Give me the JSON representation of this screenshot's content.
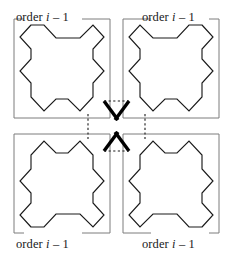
{
  "figure": {
    "width": 237,
    "height": 259,
    "background_color": "#ffffff"
  },
  "labels": {
    "prefix": "order",
    "variable": "i",
    "operator": "–",
    "offset": "1",
    "top_left": "order i – 1",
    "top_right": "order i – 1",
    "bottom_left": "order i – 1",
    "bottom_right": "order i – 1"
  },
  "colors": {
    "curve": "#1a1a1a",
    "frame": "#7d7d7d",
    "connector": "#1a1a1a",
    "join_stub": "#000000",
    "label_text": "#1a1a1a",
    "background": "#ffffff"
  },
  "strokes": {
    "curve_width": 1.15,
    "frame_width": 1.0,
    "connector_width": 1.1,
    "connector_dash": "2.2 2.4",
    "stub_width": 3.4
  },
  "geometry": {
    "cells": [
      {
        "name": "top-left",
        "x": 14,
        "y": 19,
        "w": 96,
        "h": 99,
        "flip_x": false,
        "flip_y": false,
        "label_gap_edge": "top",
        "join_corner": "bottom-right"
      },
      {
        "name": "top-right",
        "x": 123,
        "y": 19,
        "w": 96,
        "h": 99,
        "flip_x": true,
        "flip_y": false,
        "label_gap_edge": "top",
        "join_corner": "bottom-left"
      },
      {
        "name": "bottom-left",
        "x": 14,
        "y": 134,
        "w": 96,
        "h": 99,
        "flip_x": false,
        "flip_y": true,
        "label_gap_edge": "bottom",
        "join_corner": "top-right"
      },
      {
        "name": "bottom-right",
        "x": 123,
        "y": 134,
        "w": 96,
        "h": 99,
        "flip_x": true,
        "flip_y": true,
        "label_gap_edge": "bottom",
        "join_corner": "top-left"
      }
    ],
    "connectors": [
      {
        "name": "top-horizontal",
        "orientation": "horizontal",
        "x1": 104,
        "y1": 101,
        "x2": 129,
        "y2": 101
      },
      {
        "name": "bottom-horizontal",
        "orientation": "horizontal",
        "x1": 104,
        "y1": 151,
        "x2": 129,
        "y2": 151
      },
      {
        "name": "left-vertical",
        "orientation": "vertical",
        "x1": 88,
        "y1": 114,
        "x2": 88,
        "y2": 139
      },
      {
        "name": "right-vertical",
        "orientation": "vertical",
        "x1": 145,
        "y1": 114,
        "x2": 145,
        "y2": 139
      }
    ]
  }
}
